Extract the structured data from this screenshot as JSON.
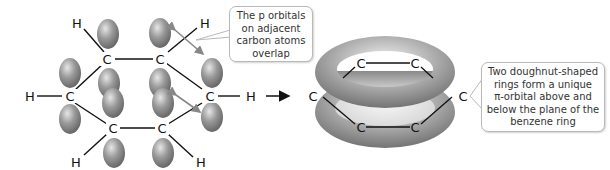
{
  "diagram": {
    "left_structure": {
      "atoms": {
        "carbon": "C",
        "hydrogen": "H"
      },
      "carbon_count": 6,
      "hydrogen_count": 6,
      "p_orbital_lobes": 12
    },
    "arrow": "→",
    "right_structure": {
      "atoms": {
        "carbon": "C"
      },
      "rings": 2
    },
    "callouts": {
      "p_orbitals": {
        "lines": [
          "The p orbitals",
          "on adjacent",
          "carbon atoms",
          "overlap"
        ]
      },
      "pi_orbital": {
        "lines": [
          "Two doughnut-shaped",
          "rings form a unique",
          "π-orbital above and",
          "below the plane of the",
          "benzene ring"
        ]
      }
    },
    "colors": {
      "orbital_fill": "#8f8f8f",
      "orbital_highlight": "#e0e0e0",
      "bond": "#111111",
      "callout_border": "#b9b9b9",
      "pointer_arrow": "#888888"
    }
  }
}
